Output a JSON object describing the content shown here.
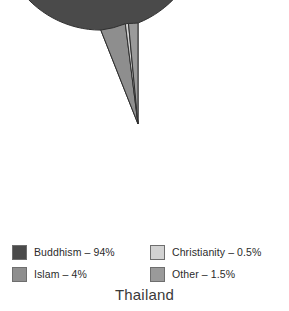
{
  "chart_data": {
    "type": "pie",
    "title": "Thailand",
    "xlabel": "",
    "ylabel": "",
    "legend_position": "bottom",
    "grid": false,
    "start_angle_deg": 90,
    "direction": "counterclockwise",
    "categories": [
      "Buddhism",
      "Islam",
      "Christianity",
      "Other"
    ],
    "values": [
      94,
      4,
      0.5,
      1.5
    ],
    "value_unit": "%",
    "slices": [
      {
        "label": "Buddhism",
        "value": 94,
        "display": "94%",
        "color": "#4a4a4a"
      },
      {
        "label": "Islam",
        "value": 4,
        "display": "4%",
        "color": "#8e8e8e"
      },
      {
        "label": "Christianity",
        "value": 0.5,
        "display": "0.5%",
        "color": "#d2d2d2"
      },
      {
        "label": "Other",
        "value": 1.5,
        "display": "1.5%",
        "color": "#9a9a9a"
      }
    ]
  },
  "legend": {
    "items": [
      {
        "label": "Buddhism – 94%",
        "color": "#4a4a4a"
      },
      {
        "label": "Christianity – 0.5%",
        "color": "#d2d2d2"
      },
      {
        "label": "Islam – 4%",
        "color": "#8e8e8e"
      },
      {
        "label": "Other – 1.5%",
        "color": "#9a9a9a"
      }
    ]
  },
  "title": {
    "text": "Thailand"
  },
  "colors": {
    "background": "#ffffff",
    "slice_outline": "#2f2f2f",
    "swatch_border": "#6e6e6e",
    "text": "#2b2b2b"
  },
  "geometry": {
    "center_x": 138,
    "center_y": 124,
    "radius": 101
  }
}
